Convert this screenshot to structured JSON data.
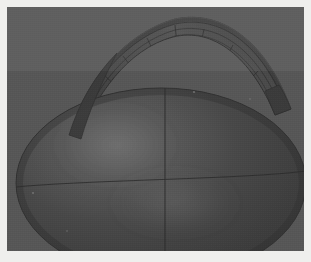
{
  "figure": {
    "kind": "3d-surface-render",
    "background_color": "#5a5a5a",
    "plate_margin_color": "#efefed",
    "viewport": {
      "x": 7,
      "y": 7,
      "width": 297,
      "height": 244
    }
  },
  "objects": {
    "ellipsoid": {
      "name": "ellipsoid-body",
      "center": [
        154,
        176
      ],
      "radius_x": 145,
      "radius_y": 95,
      "fill_color": "#464646",
      "edge_color": "#3b3b3b",
      "specular_color": "#6a6a6a",
      "specular_center": [
        108,
        140
      ],
      "gridlines": {
        "meridian_x": 158,
        "equator_y": 177,
        "line_color": "#2f2f2f"
      }
    },
    "shell": {
      "name": "shell-cap-surface",
      "fill_color": "#494949",
      "edge_color": "#333333",
      "mesh_color": "#2e2e2e",
      "u_divisions": 9,
      "v_divisions": 3,
      "left_tip": [
        62,
        128
      ],
      "right_tip": [
        282,
        100
      ],
      "apex": [
        168,
        12
      ]
    }
  },
  "palette": {
    "background": "#5a5a5a",
    "body_dark": "#3f3f3f",
    "body_mid": "#4a4a4a",
    "body_light": "#6b6b6b",
    "shell_dark": "#3a3a3a",
    "shell_mid": "#4c4c4c",
    "mesh_line": "#2d2d2d",
    "margin": "#efefed"
  },
  "chart_data": {
    "type": "scatter",
    "title": "",
    "xlabel": "",
    "ylabel": "",
    "note": "No axes, ticks, legend, or textual labels are present in the rendered image.",
    "series": [
      {
        "name": "ellipsoid-surface",
        "geometry": "oblate spheroid, semi-axes approximately 145 x 95 px in screen space",
        "visible_gridlines": [
          "central meridian",
          "equator"
        ]
      },
      {
        "name": "shell-cap-surface",
        "geometry": "curved crescent band sweeping from lower-left to right over the ellipsoid",
        "visible_gridlines": [
          "9 radial u-lines",
          "3 circumferential v-arcs"
        ]
      }
    ]
  }
}
